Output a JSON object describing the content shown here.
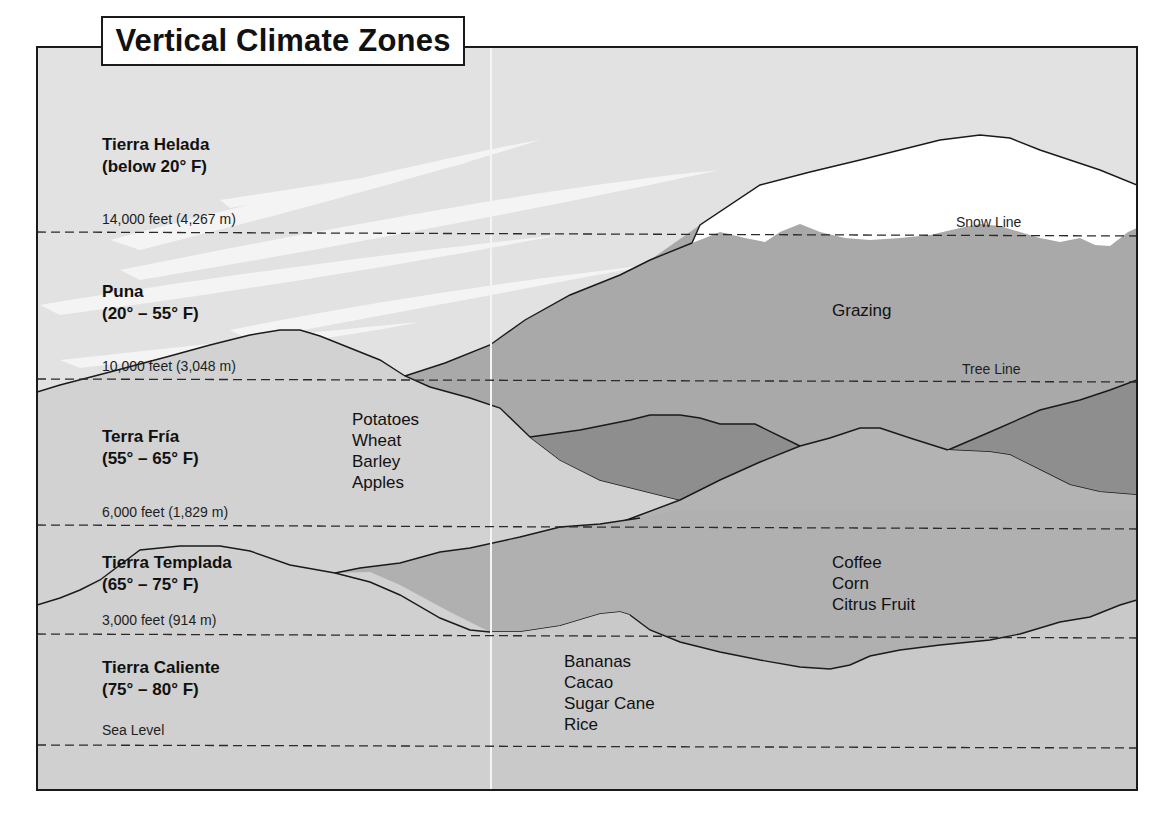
{
  "title": "Vertical Climate Zones",
  "zones": [
    {
      "name": "Tierra Helada",
      "range": "(below 20° F)"
    },
    {
      "name": "Puna",
      "range": "(20° – 55° F)"
    },
    {
      "name": "Terra Fría",
      "range": "(55° – 65° F)"
    },
    {
      "name": "Tierra Templada",
      "range": "(65° – 75° F)"
    },
    {
      "name": "Tierra Caliente",
      "range": "(75° – 80° F)"
    }
  ],
  "elevations": [
    {
      "label": "14,000 feet (4,267 m)"
    },
    {
      "label": "10,000 feet (3,048 m)"
    },
    {
      "label": "6,000 feet (1,829 m)"
    },
    {
      "label": "3,000 feet (914 m)"
    },
    {
      "label": "Sea Level"
    }
  ],
  "markers": {
    "snow_line": "Snow Line",
    "tree_line": "Tree Line"
  },
  "crops": {
    "puna": [
      "Grazing"
    ],
    "fria": [
      "Potatoes",
      "Wheat",
      "Barley",
      "Apples"
    ],
    "templada": [
      "Coffee",
      "Corn",
      "Citrus Fruit"
    ],
    "caliente": [
      "Bananas",
      "Cacao",
      "Sugar Cane",
      "Rice"
    ]
  },
  "colors": {
    "sky": "#e2e2e2",
    "snow": "#ffffff",
    "high_slope": "#a9a9a9",
    "mid_dark": "#8e8e8e",
    "fria_hill": "#d2d2d2",
    "templada_band": "#b0b0b0",
    "lowland": "#c8c8c8",
    "outline": "#1a1a1a"
  }
}
